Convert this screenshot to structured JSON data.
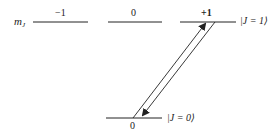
{
  "diagram": {
    "type": "energy-level-transition",
    "axis_label": {
      "base": "m",
      "subscript": "J"
    },
    "upper_level": {
      "ket": "|J = 1⟩",
      "sublevels": [
        {
          "m_J": "−1"
        },
        {
          "m_J": "0"
        },
        {
          "m_J": "+1"
        }
      ]
    },
    "lower_level": {
      "ket": "|J = 0⟩",
      "sublevels": [
        {
          "m_J": "0"
        }
      ]
    },
    "transitions": [
      {
        "from": "|J = 0⟩, m_J = 0",
        "to": "|J = 1⟩, m_J = +1",
        "direction": "up"
      },
      {
        "from": "|J = 1⟩, m_J = +1",
        "to": "|J = 0⟩, m_J = 0",
        "direction": "down"
      }
    ],
    "colors": {
      "line": "#222222",
      "background": "#ffffff"
    }
  }
}
